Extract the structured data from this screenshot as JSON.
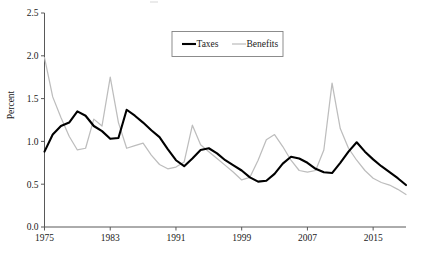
{
  "chart_data": {
    "type": "line",
    "title": "",
    "xlabel": "",
    "ylabel": "Percent",
    "xlim": [
      1975,
      2019
    ],
    "ylim": [
      0.0,
      2.5
    ],
    "grid": false,
    "legend_position": "top-center",
    "x": [
      1975,
      1976,
      1977,
      1978,
      1979,
      1980,
      1981,
      1982,
      1983,
      1984,
      1985,
      1986,
      1987,
      1988,
      1989,
      1990,
      1991,
      1992,
      1993,
      1994,
      1995,
      1996,
      1997,
      1998,
      1999,
      2000,
      2001,
      2002,
      2003,
      2004,
      2005,
      2006,
      2007,
      2008,
      2009,
      2010,
      2011,
      2012,
      2013,
      2014,
      2015,
      2016,
      2017,
      2018,
      2019
    ],
    "x_tick_labels": [
      "1975",
      "1983",
      "1991",
      "1999",
      "2007",
      "2015"
    ],
    "x_tick_values": [
      1975,
      1983,
      1991,
      1999,
      2007,
      2015
    ],
    "y_tick_labels": [
      "0.0",
      "0.5",
      "1.0",
      "1.5",
      "2.0",
      "2.5"
    ],
    "y_tick_values": [
      0.0,
      0.5,
      1.0,
      1.5,
      2.0,
      2.5
    ],
    "series": [
      {
        "name": "Taxes",
        "color": "#000000",
        "values": [
          0.88,
          1.08,
          1.18,
          1.22,
          1.35,
          1.3,
          1.18,
          1.12,
          1.03,
          1.04,
          1.37,
          1.3,
          1.22,
          1.13,
          1.05,
          0.91,
          0.78,
          0.71,
          0.8,
          0.9,
          0.92,
          0.86,
          0.78,
          0.72,
          0.66,
          0.58,
          0.53,
          0.54,
          0.62,
          0.74,
          0.82,
          0.8,
          0.75,
          0.68,
          0.64,
          0.63,
          0.75,
          0.88,
          0.99,
          0.88,
          0.79,
          0.71,
          0.64,
          0.57,
          0.49
        ]
      },
      {
        "name": "Benefits",
        "color": "#bdbdbd",
        "values": [
          1.98,
          1.52,
          1.28,
          1.06,
          0.9,
          0.92,
          1.26,
          1.18,
          1.75,
          1.22,
          0.92,
          0.95,
          0.98,
          0.84,
          0.73,
          0.68,
          0.7,
          0.76,
          1.19,
          0.96,
          0.88,
          0.8,
          0.72,
          0.64,
          0.55,
          0.58,
          0.78,
          1.02,
          1.08,
          0.94,
          0.78,
          0.66,
          0.64,
          0.66,
          0.9,
          1.68,
          1.15,
          0.92,
          0.78,
          0.66,
          0.57,
          0.52,
          0.49,
          0.44,
          0.38
        ]
      }
    ]
  },
  "legend": {
    "items": [
      {
        "label": "Taxes"
      },
      {
        "label": "Benefits"
      }
    ]
  }
}
